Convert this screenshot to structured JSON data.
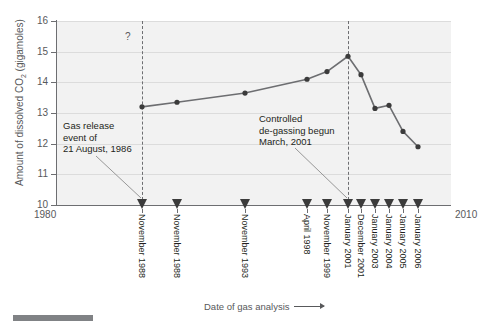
{
  "figure": {
    "background": "#ffffff",
    "plot_background": "#f2f2f2",
    "line_color": "#6d6e71",
    "marker_color": "#3b3b3b",
    "grid_color": "#dcdcdc"
  },
  "axes": {
    "y_title": "Amount of dissolved CO",
    "y_title_sub": "2",
    "y_title_tail": " (gigamoles)",
    "x_title": "Date of gas analysis",
    "x_start_label": "1980",
    "x_end_label": "2010",
    "y_ticks": [
      "16",
      "15",
      "14",
      "13",
      "12",
      "11",
      "10"
    ]
  },
  "annotations": {
    "question_mark": "?",
    "gas_release": {
      "line1": "Gas release",
      "line2": "event of",
      "line3": "21 August, 1986"
    },
    "degassing": {
      "line1": "Controlled",
      "line2": "de-gassing begun",
      "line3": "March, 2001"
    }
  },
  "event_markers": [
    {
      "label": "November 1988",
      "x": 142
    },
    {
      "label": "November 1988",
      "x": 177
    },
    {
      "label": "November 1993",
      "x": 245
    },
    {
      "label": "April 1998",
      "x": 307
    },
    {
      "label": "November 1999",
      "x": 327
    },
    {
      "label": "January 2001",
      "x": 348
    },
    {
      "label": "December 2001",
      "x": 361
    },
    {
      "label": "January 2003",
      "x": 375
    },
    {
      "label": "January 2004",
      "x": 389
    },
    {
      "label": "January 2005",
      "x": 403
    },
    {
      "label": "January 2006",
      "x": 418
    }
  ],
  "chart_data": {
    "type": "line",
    "title": "",
    "xlabel": "Date of gas analysis",
    "ylabel": "Amount of dissolved CO2 (gigamoles)",
    "ylim": [
      10,
      16
    ],
    "xlim": [
      1980,
      2010
    ],
    "grid": true,
    "legend": null,
    "x_tick_labels": [
      "1980",
      "2010"
    ],
    "y_tick_labels": [
      "10",
      "11",
      "12",
      "13",
      "14",
      "15",
      "16"
    ],
    "categories": [
      "November 1988",
      "November 1988",
      "November 1993",
      "April 1998",
      "November 1999",
      "January 2001",
      "December 2001",
      "January 2003",
      "January 2004",
      "January 2005",
      "January 2006"
    ],
    "values": [
      13.2,
      13.35,
      13.65,
      14.1,
      14.35,
      14.85,
      14.25,
      13.15,
      13.25,
      12.4,
      11.9
    ],
    "x_pixels": [
      142,
      177,
      245,
      307,
      327,
      348,
      361,
      375,
      389,
      403,
      418
    ],
    "annotations": [
      {
        "text": "?",
        "x": 1986,
        "y": 15.6
      },
      {
        "text": "Gas release event of 21 August, 1986",
        "x": 1986,
        "y": 12.4
      },
      {
        "text": "Controlled de-gassing begun March, 2001",
        "x": 2001,
        "y": 12.6
      }
    ],
    "event_lines": [
      {
        "label": "Gas release event of 21 August, 1986",
        "x_pixel": 142
      },
      {
        "label": "Controlled de-gassing begun March, 2001",
        "x_pixel": 348
      }
    ]
  }
}
